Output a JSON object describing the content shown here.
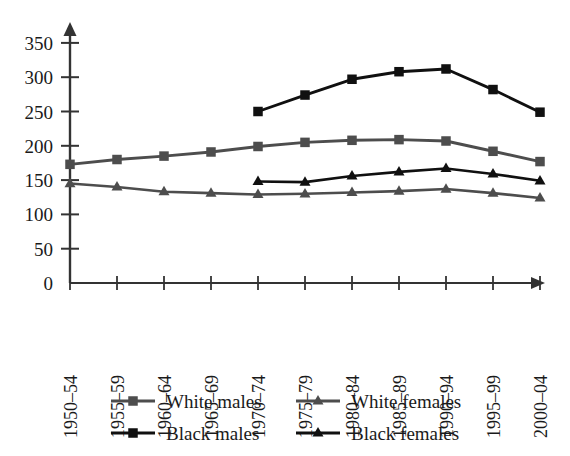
{
  "chart_data": {
    "type": "line",
    "title": "",
    "subtitle": "",
    "xlabel": "",
    "ylabel": "",
    "grid": false,
    "legend_position": "bottom",
    "categories": [
      "1950–54",
      "1955–59",
      "1960–64",
      "1965–69",
      "1970–74",
      "1975–79",
      "1980–84",
      "1985–89",
      "1990–94",
      "1995–99",
      "2000–04"
    ],
    "ylim": [
      0,
      370
    ],
    "yticks": [
      0,
      50,
      100,
      150,
      200,
      250,
      300,
      350
    ],
    "ytick_labels": [
      "0",
      "50",
      "100",
      "150",
      "200",
      "250",
      "300",
      "350"
    ],
    "series": [
      {
        "name": "White males",
        "color": "#4d4d4d",
        "marker": "square",
        "values": [
          173,
          180,
          185,
          191,
          199,
          205,
          208,
          209,
          207,
          192,
          177
        ]
      },
      {
        "name": "White females",
        "color": "#4d4d4d",
        "marker": "triangle",
        "values": [
          145,
          140,
          133,
          131,
          129,
          130,
          132,
          134,
          137,
          131,
          124
        ]
      },
      {
        "name": "Black males",
        "color": "#101010",
        "marker": "square",
        "values": [
          null,
          null,
          null,
          null,
          250,
          274,
          297,
          308,
          312,
          282,
          249
        ]
      },
      {
        "name": "Black females",
        "color": "#101010",
        "marker": "triangle",
        "values": [
          null,
          null,
          null,
          null,
          148,
          147,
          156,
          162,
          167,
          159,
          149
        ]
      }
    ]
  },
  "legend": {
    "entries": [
      {
        "label": "White males",
        "color": "#4d4d4d",
        "marker": "square"
      },
      {
        "label": "White females",
        "color": "#4d4d4d",
        "marker": "triangle"
      },
      {
        "label": "Black males",
        "color": "#101010",
        "marker": "square"
      },
      {
        "label": "Black females",
        "color": "#101010",
        "marker": "triangle"
      }
    ]
  },
  "axes": {
    "axis_color": "#333333",
    "y_axis_name": "value-axis",
    "x_axis_name": "period-axis"
  }
}
